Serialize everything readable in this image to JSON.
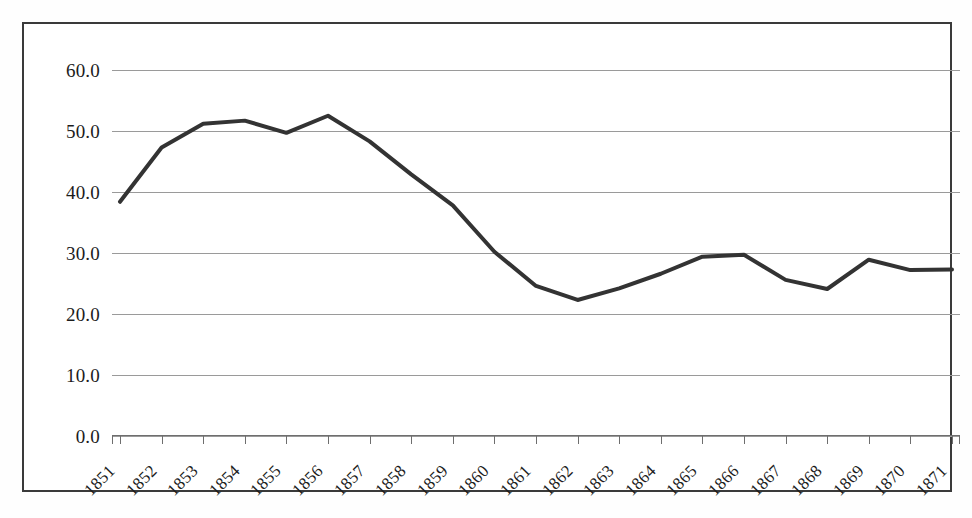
{
  "figure": {
    "background_color": "#ffffff",
    "frame_color": "#3a3a3a",
    "gridline_color": "#9a9a9a",
    "axis_color": "#6e6e6e"
  },
  "chart_data": {
    "type": "line",
    "title": "",
    "subtitle": "",
    "xlabel": "",
    "ylabel": "",
    "legend": [],
    "legend_position": "none",
    "grid": true,
    "grid_axis": "y",
    "line_color": "#333333",
    "line_width": 4,
    "markers": false,
    "ylim": [
      0.0,
      60.0
    ],
    "ytick_step": 10.0,
    "yticks": [
      "60.0",
      "50.0",
      "40.0",
      "30.0",
      "20.0",
      "10.0",
      "0.0"
    ],
    "ytick_values": [
      60.0,
      50.0,
      40.0,
      30.0,
      20.0,
      10.0,
      0.0
    ],
    "categories": [
      "1851",
      "1852",
      "1853",
      "1854",
      "1855",
      "1856",
      "1857",
      "1858",
      "1859",
      "1860",
      "1861",
      "1862",
      "1863",
      "1864",
      "1865",
      "1866",
      "1867",
      "1868",
      "1869",
      "1870",
      "1871"
    ],
    "xtick_rotation": -45,
    "values": [
      38.4,
      47.3,
      51.2,
      51.7,
      49.7,
      52.5,
      48.3,
      42.9,
      37.8,
      30.2,
      24.6,
      22.3,
      24.2,
      26.6,
      29.4,
      29.7,
      25.6,
      24.1,
      28.9,
      27.2,
      27.3
    ],
    "series": [
      {
        "name": "series-1",
        "color": "#333333",
        "values": [
          38.4,
          47.3,
          51.2,
          51.7,
          49.7,
          52.5,
          48.3,
          42.9,
          37.8,
          30.2,
          24.6,
          22.3,
          24.2,
          26.6,
          29.4,
          29.7,
          25.6,
          24.1,
          28.9,
          27.2,
          27.3
        ]
      }
    ],
    "annotations": []
  }
}
